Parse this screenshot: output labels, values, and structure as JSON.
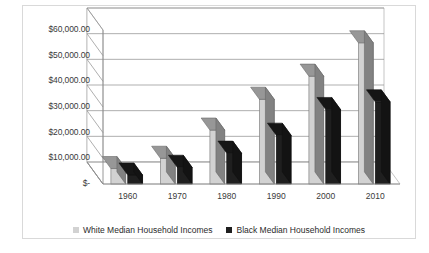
{
  "chart_data": {
    "type": "bar",
    "title": "",
    "subtitle": "",
    "xlabel": "",
    "ylabel": "",
    "categories": [
      "1960",
      "1970",
      "1980",
      "1990",
      "2000",
      "2010"
    ],
    "series": [
      {
        "name": "White Median Household Incomes",
        "color": "#d2d2d2",
        "values": [
          6000,
          10000,
          21000,
          33000,
          42000,
          55000
        ]
      },
      {
        "name": "Black Median Household Incomes",
        "color": "#1f1f1f",
        "values": [
          3500,
          6500,
          12000,
          19000,
          29000,
          32000
        ]
      }
    ],
    "ylim": [
      0,
      60000
    ],
    "ytick_values": [
      0,
      10000,
      20000,
      30000,
      40000,
      50000,
      60000
    ],
    "ytick_labels": [
      "$-",
      "$10,000.00",
      "$20,000.00",
      "$30,000.00",
      "$40,000.00",
      "$50,000.00",
      "$60,000.00"
    ],
    "grid": true,
    "legend_position": "bottom",
    "three_d": true
  },
  "legend": {
    "entries": [
      {
        "label": "White Median Household Incomes"
      },
      {
        "label": "Black Median Household Incomes"
      }
    ]
  }
}
